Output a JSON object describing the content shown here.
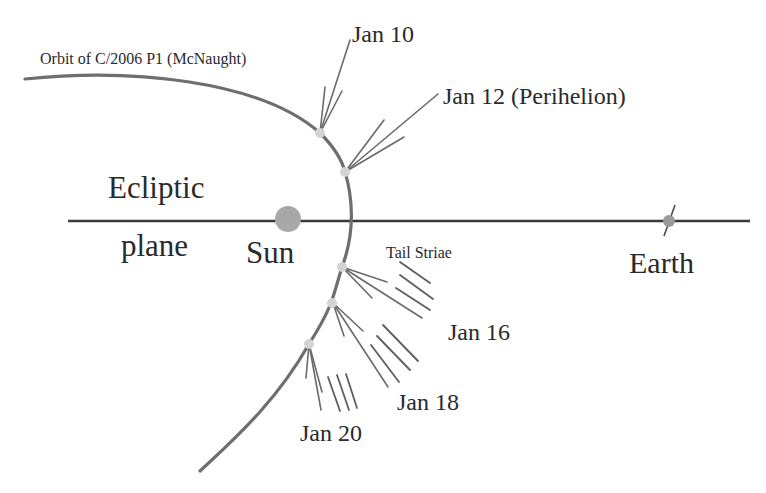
{
  "title": "Orbit of C/2006 P1 (McNaught)",
  "labels": {
    "orbit": "Orbit of C/2006 P1 (McNaught)",
    "ecliptic_line1": "Ecliptic",
    "ecliptic_line2": "plane",
    "sun": "Sun",
    "earth": "Earth",
    "tail_striae": "Tail Striae"
  },
  "dates": [
    {
      "label": "Jan 10",
      "note": ""
    },
    {
      "label": "Jan 12 (Perihelion)",
      "note": "Perihelion"
    },
    {
      "label": "Jan 16",
      "note": ""
    },
    {
      "label": "Jan 18",
      "note": ""
    },
    {
      "label": "Jan 20",
      "note": ""
    }
  ],
  "colors": {
    "orbit": "#6e6e6e",
    "ecliptic": "#3a3a3a",
    "sun": "#a8a8a8",
    "earth": "#9a9a9a",
    "text": "#2a2a2a",
    "background": "#ffffff"
  }
}
